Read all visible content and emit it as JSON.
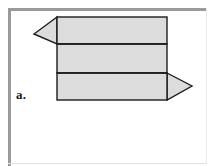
{
  "figure": {
    "label": "a.",
    "caption": "",
    "background_color": "#ffffff",
    "frame_color": "#9a9a9a",
    "shape_fill_color": "#dcdcdc",
    "shape_stroke_color": "#1c1c1c"
  },
  "chart_data": {
    "type": "diagram",
    "title": "",
    "subtitle": "",
    "xlabel": "",
    "ylabel": "",
    "label": "a.",
    "segments": [
      {
        "name": "top-segment",
        "x": 57,
        "y": 17,
        "width": 110,
        "height": 27,
        "fill": "#dcdcdc"
      },
      {
        "name": "middle-segment",
        "x": 57,
        "y": 44,
        "width": 110,
        "height": 29,
        "fill": "#dcdcdc"
      },
      {
        "name": "bottom-segment",
        "x": 57,
        "y": 73,
        "width": 110,
        "height": 27,
        "fill": "#dcdcdc"
      }
    ],
    "dividers": [
      {
        "name": "divider-upper",
        "y": 44,
        "x1": 57,
        "x2": 167
      },
      {
        "name": "divider-lower",
        "y": 73,
        "x1": 57,
        "x2": 167
      }
    ],
    "arrowheads": [
      {
        "name": "left-arrowhead",
        "direction": "left",
        "tip_x": 34,
        "tip_y": 34,
        "attached_segment": "top-segment",
        "base_x": 57,
        "base_top_y": 17,
        "base_bottom_y": 44
      },
      {
        "name": "right-arrowhead",
        "direction": "right",
        "tip_x": 192,
        "tip_y": 86,
        "attached_segment": "bottom-segment",
        "base_x": 167,
        "base_top_y": 73,
        "base_bottom_y": 100
      }
    ],
    "grid": false,
    "legend": null
  }
}
